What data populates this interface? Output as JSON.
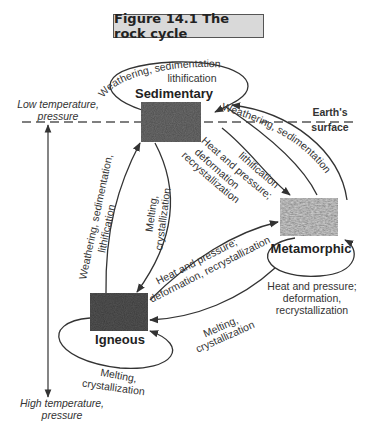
{
  "figure": {
    "title": "Figure 14.1  The rock cycle"
  },
  "axis": {
    "top_label_line1": "Low temperature,",
    "top_label_line2": "pressure",
    "bottom_label_line1": "High temperature,",
    "bottom_label_line2": "pressure"
  },
  "surface": {
    "label_line1": "Earth's",
    "label_line2": "surface"
  },
  "rocks": {
    "sedimentary": {
      "label": "Sedimentary",
      "color": "#6e6e6e"
    },
    "metamorphic": {
      "label": "Metamorphic",
      "color": "#7a7a7a"
    },
    "igneous": {
      "label": "Igneous",
      "color": "#555555"
    }
  },
  "processes": {
    "sed_loop_line1": "Weathering, sedimentation",
    "sed_loop_line2": "lithification",
    "meta_to_sed_line1": "Weathering, sedimentation",
    "meta_to_sed_line2": "lithification",
    "sed_to_meta_line1": "Heat and pressure;",
    "sed_to_meta_line2": "deformation",
    "sed_to_meta_line3": "recrystallization",
    "ign_to_sed_line1": "Weathering, sedimentation,",
    "ign_to_sed_line2": "lithification",
    "sed_to_ign_line1": "Melting,",
    "sed_to_ign_line2": "crystallization",
    "ign_to_meta_line1": "Heat and pressure;",
    "ign_to_meta_line2": "deformation, recrystallization",
    "meta_loop_line1": "Heat and pressure;",
    "meta_loop_line2": "deformation,",
    "meta_loop_line3": "recrystallization",
    "meta_to_ign_line1": "Melting,",
    "meta_to_ign_line2": "crystallization",
    "ign_loop_line1": "Melting,",
    "ign_loop_line2": "crystallization"
  }
}
